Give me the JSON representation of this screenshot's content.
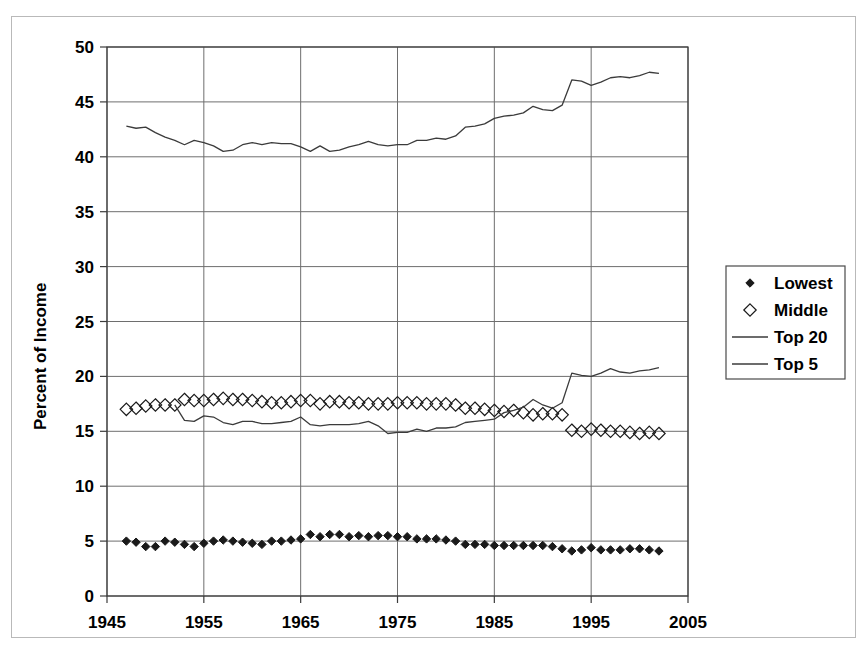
{
  "chart_data": {
    "type": "line",
    "title": "",
    "xlabel": "",
    "ylabel": "Percent of Income",
    "xlim": [
      1945,
      2005
    ],
    "ylim": [
      0,
      50
    ],
    "ytick_step": 5,
    "xtick_step": 10,
    "xticks": [
      "1945",
      "1955",
      "1965",
      "1975",
      "1985",
      "1995",
      "2005"
    ],
    "yticks": [
      "0",
      "5",
      "10",
      "15",
      "20",
      "25",
      "30",
      "35",
      "40",
      "45",
      "50"
    ],
    "grid": true,
    "legend_position": "right",
    "x": [
      1947,
      1948,
      1949,
      1950,
      1951,
      1952,
      1953,
      1954,
      1955,
      1956,
      1957,
      1958,
      1959,
      1960,
      1961,
      1962,
      1963,
      1964,
      1965,
      1966,
      1967,
      1968,
      1969,
      1970,
      1971,
      1972,
      1973,
      1974,
      1975,
      1976,
      1977,
      1978,
      1979,
      1980,
      1981,
      1982,
      1983,
      1984,
      1985,
      1986,
      1987,
      1988,
      1989,
      1990,
      1991,
      1992,
      1993,
      1994,
      1995,
      1996,
      1997,
      1998,
      1999,
      2000,
      2001,
      2002
    ],
    "series": [
      {
        "name": "Lowest",
        "marker": "filled-diamond",
        "line": false,
        "values": [
          5.0,
          4.9,
          4.5,
          4.5,
          5.0,
          4.9,
          4.7,
          4.5,
          4.8,
          5.0,
          5.1,
          5.0,
          4.9,
          4.8,
          4.7,
          5.0,
          5.0,
          5.1,
          5.2,
          5.6,
          5.4,
          5.6,
          5.6,
          5.4,
          5.5,
          5.4,
          5.5,
          5.5,
          5.4,
          5.4,
          5.2,
          5.2,
          5.2,
          5.1,
          5.0,
          4.7,
          4.7,
          4.7,
          4.6,
          4.6,
          4.6,
          4.6,
          4.6,
          4.6,
          4.5,
          4.3,
          4.1,
          4.2,
          4.4,
          4.2,
          4.2,
          4.2,
          4.3,
          4.3,
          4.2,
          4.1
        ]
      },
      {
        "name": "Middle",
        "marker": "open-diamond",
        "line": false,
        "values": [
          17.0,
          17.1,
          17.3,
          17.4,
          17.4,
          17.4,
          17.9,
          17.8,
          17.8,
          17.9,
          18.0,
          17.9,
          17.9,
          17.8,
          17.7,
          17.6,
          17.6,
          17.7,
          17.8,
          17.8,
          17.5,
          17.7,
          17.7,
          17.6,
          17.6,
          17.5,
          17.5,
          17.5,
          17.6,
          17.6,
          17.6,
          17.5,
          17.5,
          17.5,
          17.4,
          17.1,
          17.1,
          17.0,
          16.9,
          16.8,
          16.9,
          16.7,
          16.5,
          16.6,
          16.6,
          16.5,
          15.1,
          15.0,
          15.2,
          15.1,
          15.0,
          15.0,
          14.9,
          14.8,
          14.9,
          14.8
        ]
      },
      {
        "name": "Top 20",
        "marker": "none",
        "line": true,
        "values": [
          42.8,
          42.6,
          42.7,
          42.2,
          41.8,
          41.5,
          41.1,
          41.5,
          41.3,
          41.0,
          40.5,
          40.6,
          41.1,
          41.3,
          41.1,
          41.3,
          41.2,
          41.2,
          40.9,
          40.5,
          41.0,
          40.5,
          40.6,
          40.9,
          41.1,
          41.4,
          41.1,
          41.0,
          41.1,
          41.1,
          41.5,
          41.5,
          41.7,
          41.6,
          41.9,
          42.7,
          42.8,
          43.0,
          43.5,
          43.7,
          43.8,
          44.0,
          44.6,
          44.3,
          44.2,
          44.7,
          47.0,
          46.9,
          46.5,
          46.8,
          47.2,
          47.3,
          47.2,
          47.4,
          47.7,
          47.6
        ]
      },
      {
        "name": "Top 5",
        "marker": "none",
        "line": true,
        "values": [
          null,
          null,
          null,
          null,
          null,
          17.4,
          16.0,
          15.9,
          16.4,
          16.3,
          15.8,
          15.6,
          15.9,
          15.9,
          15.7,
          15.7,
          15.8,
          15.9,
          16.3,
          15.6,
          15.5,
          15.6,
          15.6,
          15.6,
          15.7,
          15.9,
          15.5,
          14.8,
          14.9,
          14.9,
          15.2,
          15.0,
          15.3,
          15.3,
          15.4,
          15.8,
          15.9,
          16.0,
          16.1,
          16.7,
          16.9,
          17.2,
          17.9,
          17.4,
          17.1,
          17.6,
          20.3,
          20.1,
          20.0,
          20.3,
          20.7,
          20.4,
          20.3,
          20.5,
          20.6,
          20.8
        ]
      }
    ]
  },
  "legend": {
    "items": [
      {
        "label": "Lowest",
        "marker": "filled-diamond"
      },
      {
        "label": "Middle",
        "marker": "open-diamond"
      },
      {
        "label": "Top 20",
        "marker": "line"
      },
      {
        "label": "Top 5",
        "marker": "line"
      }
    ]
  },
  "colors": {
    "line": "#3b3b3b",
    "grid": "#6e6e6e",
    "axis": "#3b3b3b",
    "text": "#000000",
    "frame": "#b9b9b9",
    "background": "#ffffff"
  }
}
